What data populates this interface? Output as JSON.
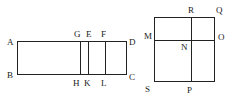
{
  "figures": [
    {
      "id": "rectangle-ABCD",
      "labels": {
        "A": "A",
        "B": "B",
        "C": "C",
        "D": "D",
        "G": "G",
        "E": "E",
        "F": "F",
        "H": "H",
        "K": "K",
        "L": "L"
      },
      "divisions": [
        "GH",
        "EK",
        "FL"
      ]
    },
    {
      "id": "square-SQ",
      "labels": {
        "R": "R",
        "Q": "Q",
        "M": "M",
        "O": "O",
        "N": "N",
        "S": "S",
        "P": "P"
      },
      "divisions": [
        "MO",
        "RP"
      ]
    }
  ],
  "colors": {
    "stroke": "#222222",
    "background": "#ffffff"
  }
}
